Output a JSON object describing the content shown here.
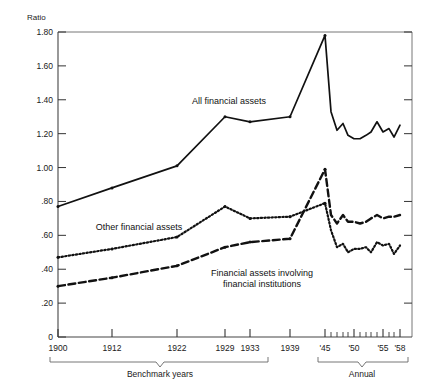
{
  "chart_data": {
    "type": "line",
    "title": "",
    "ylabel": "Ratio",
    "xlabel": "",
    "ylim": [
      0,
      1.8
    ],
    "yticks": [
      "0",
      ".20",
      ".40",
      ".60",
      ".80",
      "1.00",
      "1.20",
      "1.40",
      "1.60",
      "1.80"
    ],
    "ytick_values": [
      0,
      0.2,
      0.4,
      0.6,
      0.8,
      1.0,
      1.2,
      1.4,
      1.6,
      1.8
    ],
    "grid": false,
    "legend_position": "inline-annotations",
    "xtick_labels": [
      "1900",
      "1912",
      "1922",
      "1929",
      "1933",
      "1939",
      "'45",
      "'50",
      "'55",
      "'58"
    ],
    "xtick_values": [
      1900,
      1912,
      1922,
      1929,
      1933,
      1939,
      1945,
      1950,
      1955,
      1958
    ],
    "x_segments": [
      {
        "name": "Benchmark years",
        "from": 1900,
        "to": 1939
      },
      {
        "name": "Annual",
        "from": 1945,
        "to": 1958
      }
    ],
    "series": [
      {
        "name": "All financial assets",
        "style": "solid",
        "x": [
          1900,
          1912,
          1922,
          1929,
          1933,
          1939,
          1945,
          1946,
          1947,
          1948,
          1949,
          1950,
          1951,
          1952,
          1953,
          1954,
          1955,
          1956,
          1957,
          1958
        ],
        "values": [
          0.77,
          0.88,
          1.01,
          1.3,
          1.27,
          1.3,
          1.78,
          1.33,
          1.22,
          1.26,
          1.19,
          1.17,
          1.17,
          1.19,
          1.21,
          1.27,
          1.21,
          1.23,
          1.18,
          1.25
        ]
      },
      {
        "name": "Other financial assets",
        "style": "dotted",
        "x": [
          1900,
          1912,
          1922,
          1929,
          1933,
          1939,
          1945,
          1946,
          1947,
          1948,
          1949,
          1950,
          1951,
          1952,
          1953,
          1954,
          1955,
          1956,
          1957,
          1958
        ],
        "values": [
          0.47,
          0.52,
          0.59,
          0.77,
          0.7,
          0.71,
          0.79,
          0.63,
          0.53,
          0.55,
          0.5,
          0.52,
          0.52,
          0.53,
          0.5,
          0.56,
          0.54,
          0.55,
          0.49,
          0.54
        ]
      },
      {
        "name": "Financial assets involving financial institutions",
        "style": "dashed",
        "x": [
          1900,
          1912,
          1922,
          1929,
          1933,
          1939,
          1945,
          1946,
          1947,
          1948,
          1949,
          1950,
          1951,
          1952,
          1953,
          1954,
          1955,
          1956,
          1957,
          1958
        ],
        "values": [
          0.3,
          0.35,
          0.42,
          0.53,
          0.56,
          0.58,
          0.99,
          0.72,
          0.67,
          0.72,
          0.68,
          0.68,
          0.67,
          0.68,
          0.7,
          0.72,
          0.7,
          0.71,
          0.71,
          0.72
        ]
      }
    ],
    "annotations": [
      {
        "name": "All financial assets",
        "x": 229,
        "y": 104
      },
      {
        "name": "Other financial assets",
        "x": 139,
        "y": 227
      },
      {
        "name": "Financial assets involving",
        "x": 262,
        "y": 272
      },
      {
        "name": "financial institutions",
        "x": 262,
        "y": 283
      }
    ],
    "colors": {
      "line": "#111111",
      "axis": "#555555",
      "background": "#ffffff"
    }
  },
  "labels": {
    "unit": "Ratio",
    "bracket_left": "Benchmark years",
    "bracket_right": "Annual",
    "series1": "All financial assets",
    "series2": "Other financial assets",
    "series3_line1": "Financial assets involving",
    "series3_line2": "financial institutions"
  }
}
